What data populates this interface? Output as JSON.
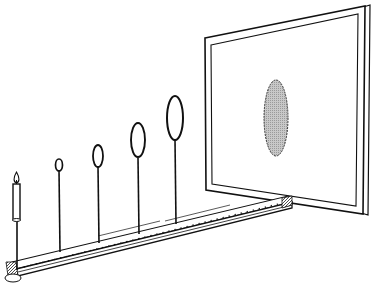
{
  "diagram": {
    "title": "Inverse square law demonstration: candle, apertures on optical bench, projection screen",
    "colors": {
      "ink": "#111111",
      "paper": "#ffffff",
      "spot_fill": "#bdbdbd"
    },
    "elements": {
      "candle": "candle-icon",
      "bench": "optical-bench",
      "apertures": [
        {
          "name": "aperture-1",
          "size": "smallest"
        },
        {
          "name": "aperture-2",
          "size": "small"
        },
        {
          "name": "aperture-3",
          "size": "medium"
        },
        {
          "name": "aperture-4",
          "size": "largest"
        }
      ],
      "screen": "projection-screen",
      "spot": "illuminated-spot"
    }
  }
}
